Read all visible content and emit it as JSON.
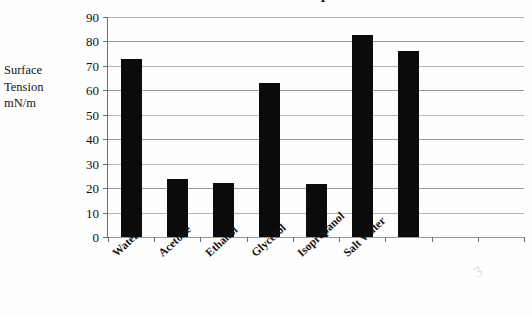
{
  "figure": {
    "title_fragment": "Surface Tension of Liquids",
    "background_color": "#fefefe",
    "bar_color": "#0b0b0b",
    "gridline_color": "#9a9a9a",
    "axis_color": "#6e6e6e",
    "smudge_mark": "3"
  },
  "axis": {
    "y_title_lines": [
      "Surface",
      "Tension",
      "mN/m"
    ],
    "y_ticks": [
      "90",
      "80",
      "70",
      "60",
      "50",
      "40",
      "30",
      "20",
      "10",
      "0"
    ]
  },
  "chart_data": {
    "type": "bar",
    "title": "Surface Tension of Liquids",
    "xlabel": "",
    "ylabel": "Surface Tension mN/m",
    "ylim": [
      0,
      90
    ],
    "ytick_step": 10,
    "grid": true,
    "legend": "none",
    "categories": [
      "Water",
      "Acetone",
      "Ethanol",
      "Glycerol",
      "Isopropanol",
      "Salt Water",
      ""
    ],
    "values": [
      72.8,
      23.7,
      22.3,
      63.0,
      21.5,
      82.5,
      76.2
    ],
    "units": "mN/m",
    "n_category_slots": 9
  }
}
